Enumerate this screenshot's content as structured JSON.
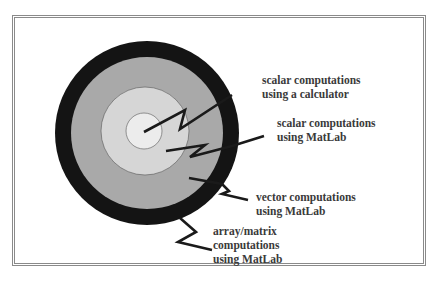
{
  "diagram": {
    "type": "concentric-circles",
    "colors": {
      "outer_ring": "#141414",
      "middle_ring": "#a9a9a9",
      "inner_ring": "#d6d6d6",
      "core": "#ececec",
      "border": "#8a8a8a",
      "text": "#3a3a3a"
    },
    "labels": [
      {
        "line1": "scalar computations",
        "line2": "using a calculator"
      },
      {
        "line1": "scalar computations",
        "line2": "using MatLab"
      },
      {
        "line1": "vector computations",
        "line2": "using MatLab"
      },
      {
        "line1": "array/matrix",
        "line2": "computations",
        "line3": "using MatLab"
      }
    ]
  }
}
